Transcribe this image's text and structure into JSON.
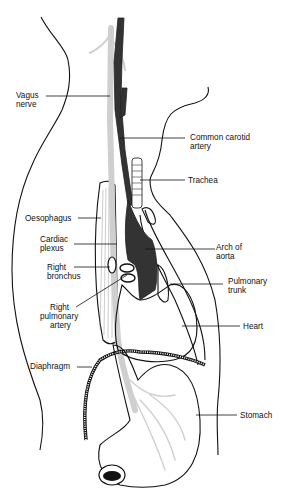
{
  "diagram": {
    "labels": [
      {
        "id": "vagus",
        "lines": [
          "Vagus",
          "nerve"
        ]
      },
      {
        "id": "carotid",
        "lines": [
          "Common carotid",
          "artery"
        ]
      },
      {
        "id": "trachea",
        "lines": [
          "Trachea"
        ]
      },
      {
        "id": "oesophagus",
        "lines": [
          "Oesophagus"
        ]
      },
      {
        "id": "cardiac",
        "lines": [
          "Cardiac",
          "plexus"
        ]
      },
      {
        "id": "arch",
        "lines": [
          "Arch of",
          "aorta"
        ]
      },
      {
        "id": "bronchus",
        "lines": [
          "Right",
          "bronchus"
        ]
      },
      {
        "id": "pulmonary_trunk",
        "lines": [
          "Pulmonary",
          "trunk"
        ]
      },
      {
        "id": "pulmonary_artery",
        "lines": [
          "Right",
          "pulmonary",
          "artery"
        ]
      },
      {
        "id": "heart",
        "lines": [
          "Heart"
        ]
      },
      {
        "id": "diaphragm",
        "lines": [
          "Diaphragm"
        ]
      },
      {
        "id": "stomach",
        "lines": [
          "Stomach"
        ]
      }
    ],
    "colors": {
      "line": "#111111",
      "nerve": "#cfcfcf",
      "vessel": "#333333",
      "background": "#ffffff"
    }
  }
}
